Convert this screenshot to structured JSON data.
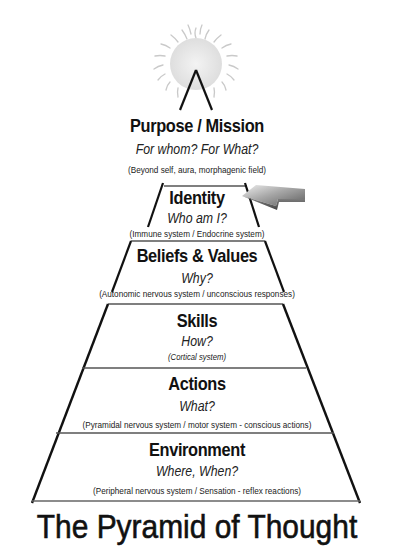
{
  "diagram": {
    "title": "The Pyramid of Thought",
    "top_icon": "sun-icon",
    "pointer_icon": "arrow-left-icon",
    "pointer_target": "Identity",
    "levels": [
      {
        "title": "Purpose / Mission",
        "question": "For whom?  For What?",
        "note": "(Beyond self, aura, morphagenic field)"
      },
      {
        "title": "Identity",
        "question": "Who am I?",
        "note": "(Immune system / Endocrine system)"
      },
      {
        "title": "Beliefs & Values",
        "question": "Why?",
        "note": "(Autonomic nervous system / unconscious responses)"
      },
      {
        "title": "Skills",
        "question": "How?",
        "note": "(Cortical system)"
      },
      {
        "title": "Actions",
        "question": "What?",
        "note": "(Pyramidal nervous system / motor system - conscious actions)"
      },
      {
        "title": "Environment",
        "question": "Where, When?",
        "note": "(Peripheral nervous system / Sensation - reflex reactions)"
      }
    ]
  },
  "colors": {
    "line": "#111111",
    "divider": "#555555",
    "sun_fill": "#e9e9e9",
    "sun_rays": "#c8c8c8",
    "arrow_light": "#d8d8d8",
    "arrow_dark": "#6a6a6a",
    "background": "#ffffff"
  }
}
